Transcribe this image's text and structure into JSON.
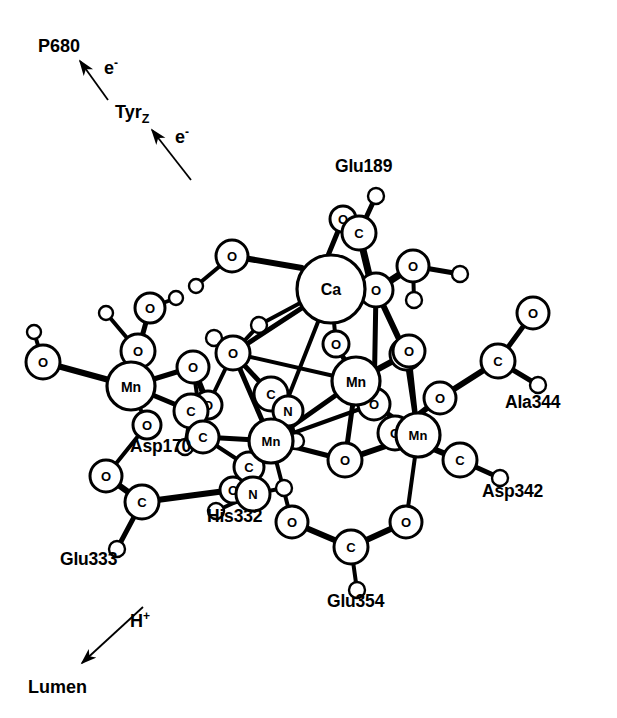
{
  "figure": {
    "background_color": "#ffffff",
    "line_color": "#000000",
    "atom_fill": "#ffffff"
  },
  "flow": {
    "p680_label": "P680",
    "electron_label_upper": "e",
    "electron_sup_upper": "-",
    "tyr_label": "Tyr",
    "tyr_sub": "Z",
    "electron_label_lower": "e",
    "electron_sup_lower": "-",
    "proton_label": "H",
    "proton_sup": "+",
    "lumen_label": "Lumen"
  },
  "residues": [
    {
      "id": "glu189",
      "label": "Glu189",
      "x": 335,
      "y": 172
    },
    {
      "id": "ala344",
      "label": "Ala344",
      "x": 505,
      "y": 408
    },
    {
      "id": "asp342",
      "label": "Asp342",
      "x": 482,
      "y": 497
    },
    {
      "id": "asp170",
      "label": "Asp170",
      "x": 130,
      "y": 452
    },
    {
      "id": "his332",
      "label": "His332",
      "x": 207,
      "y": 522
    },
    {
      "id": "glu333",
      "label": "Glu333",
      "x": 60,
      "y": 565
    },
    {
      "id": "glu354",
      "label": "Glu354",
      "x": 327,
      "y": 607
    }
  ],
  "metals": [
    {
      "id": "ca",
      "symbol": "Ca",
      "x": 331,
      "y": 289,
      "r": 34,
      "font": 16
    },
    {
      "id": "mn1",
      "symbol": "Mn",
      "x": 356,
      "y": 381,
      "r": 24,
      "font": 14
    },
    {
      "id": "mn2",
      "symbol": "Mn",
      "x": 418,
      "y": 435,
      "r": 22,
      "font": 13
    },
    {
      "id": "mn3",
      "symbol": "Mn",
      "x": 271,
      "y": 441,
      "r": 22,
      "font": 13
    },
    {
      "id": "mn4",
      "symbol": "Mn",
      "x": 131,
      "y": 386,
      "r": 24,
      "font": 14
    }
  ],
  "oxygens": [
    {
      "id": "o-bridge-ca",
      "symbol": "O",
      "x": 376,
      "y": 290,
      "r": 17
    },
    {
      "id": "o-core-up",
      "symbol": "O",
      "x": 336,
      "y": 344,
      "r": 13
    },
    {
      "id": "o-core-mid",
      "symbol": "O",
      "x": 374,
      "y": 404,
      "r": 16
    },
    {
      "id": "o-core-low",
      "symbol": "O",
      "x": 345,
      "y": 460,
      "r": 17
    },
    {
      "id": "o-core-right",
      "symbol": "O",
      "x": 406,
      "y": 354,
      "r": 16
    },
    {
      "id": "o-water-top",
      "symbol": "O",
      "x": 232,
      "y": 256,
      "r": 16
    },
    {
      "id": "o-water-right",
      "symbol": "O",
      "x": 413,
      "y": 266,
      "r": 16
    },
    {
      "id": "o-glu189",
      "symbol": "O",
      "x": 343,
      "y": 219,
      "r": 13
    },
    {
      "id": "o-left-term",
      "symbol": "O",
      "x": 43,
      "y": 362,
      "r": 17
    },
    {
      "id": "o-mn4-top",
      "symbol": "O",
      "x": 138,
      "y": 351,
      "r": 17
    },
    {
      "id": "o-water-mn4",
      "symbol": "O",
      "x": 150,
      "y": 308,
      "r": 15
    },
    {
      "id": "o-asp170-a",
      "symbol": "O",
      "x": 193,
      "y": 367,
      "r": 16
    },
    {
      "id": "o-asp170-b",
      "symbol": "O",
      "x": 147,
      "y": 425,
      "r": 14
    },
    {
      "id": "o-glu333",
      "symbol": "O",
      "x": 106,
      "y": 476,
      "r": 16
    },
    {
      "id": "o-his-link",
      "symbol": "O",
      "x": 233,
      "y": 490,
      "r": 13
    },
    {
      "id": "o-core-left",
      "symbol": "O",
      "x": 233,
      "y": 353,
      "r": 17
    },
    {
      "id": "o-glu354-l",
      "symbol": "O",
      "x": 292,
      "y": 522,
      "r": 16
    },
    {
      "id": "o-glu354-r",
      "symbol": "O",
      "x": 406,
      "y": 522,
      "r": 16
    },
    {
      "id": "o-asp342",
      "symbol": "O",
      "x": 395,
      "y": 433,
      "r": 17
    },
    {
      "id": "o-ala344-link",
      "symbol": "O",
      "x": 440,
      "y": 398,
      "r": 16
    },
    {
      "id": "o-ala344-term",
      "symbol": "O",
      "x": 533,
      "y": 313,
      "r": 16
    },
    {
      "id": "o-mn2-right",
      "symbol": "O",
      "x": 409,
      "y": 351,
      "r": 16
    },
    {
      "id": "o-asp170-c",
      "symbol": "O",
      "x": 208,
      "y": 405,
      "r": 14
    }
  ],
  "carbons": [
    {
      "id": "c-glu189",
      "symbol": "C",
      "x": 359,
      "y": 233,
      "r": 17
    },
    {
      "id": "c-asp170",
      "symbol": "C",
      "x": 191,
      "y": 411,
      "r": 17
    },
    {
      "id": "c-glu333",
      "symbol": "C",
      "x": 142,
      "y": 502,
      "r": 17
    },
    {
      "id": "c-glu354",
      "symbol": "C",
      "x": 351,
      "y": 547,
      "r": 17
    },
    {
      "id": "c-asp342",
      "symbol": "C",
      "x": 460,
      "y": 460,
      "r": 17
    },
    {
      "id": "c-ala344",
      "symbol": "C",
      "x": 498,
      "y": 361,
      "r": 17
    },
    {
      "id": "c-his-a",
      "symbol": "C",
      "x": 271,
      "y": 394,
      "r": 17
    },
    {
      "id": "c-his-b",
      "symbol": "C",
      "x": 249,
      "y": 467,
      "r": 15
    },
    {
      "id": "c-core-l",
      "symbol": "C",
      "x": 203,
      "y": 437,
      "r": 16
    }
  ],
  "nitrogens": [
    {
      "id": "n-his-ring",
      "symbol": "N",
      "x": 288,
      "y": 411,
      "r": 15
    },
    {
      "id": "n-his-base",
      "symbol": "N",
      "x": 253,
      "y": 494,
      "r": 17
    }
  ],
  "hydrogens": [
    {
      "id": "h-left-1",
      "x": 34,
      "y": 332,
      "r": 7
    },
    {
      "id": "h-water-t1",
      "x": 196,
      "y": 286,
      "r": 7
    },
    {
      "id": "h-water-r1",
      "x": 460,
      "y": 274,
      "r": 8
    },
    {
      "id": "h-water-r2",
      "x": 414,
      "y": 300,
      "r": 8
    },
    {
      "id": "h-glu189",
      "x": 376,
      "y": 196,
      "r": 8
    },
    {
      "id": "h-mn4-w1",
      "x": 106,
      "y": 313,
      "r": 7
    },
    {
      "id": "h-mn4-w2",
      "x": 176,
      "y": 298,
      "r": 7
    },
    {
      "id": "h-asp170",
      "x": 185,
      "y": 447,
      "r": 8
    },
    {
      "id": "h-glu333",
      "x": 117,
      "y": 549,
      "r": 8
    },
    {
      "id": "h-glu354",
      "x": 357,
      "y": 590,
      "r": 8
    },
    {
      "id": "h-asp342",
      "x": 500,
      "y": 478,
      "r": 8
    },
    {
      "id": "h-ala344",
      "x": 538,
      "y": 385,
      "r": 8
    },
    {
      "id": "h-his-1",
      "x": 284,
      "y": 488,
      "r": 8
    },
    {
      "id": "h-his-2",
      "x": 216,
      "y": 511,
      "r": 8
    },
    {
      "id": "h-his-3",
      "x": 296,
      "y": 441,
      "r": 8
    },
    {
      "id": "h-core-1",
      "x": 214,
      "y": 338,
      "r": 8
    },
    {
      "id": "h-core-2",
      "x": 259,
      "y": 325,
      "r": 8
    }
  ]
}
